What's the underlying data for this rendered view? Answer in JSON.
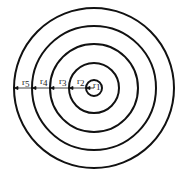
{
  "diagram": {
    "type": "concentric-circles",
    "center": [
      94,
      88
    ],
    "radii": [
      8,
      25,
      44,
      62,
      80
    ],
    "stroke_color": "#111111",
    "labels": [
      {
        "base": "r",
        "sub": "1",
        "x": 89,
        "y": 88
      },
      {
        "base": "r",
        "sub": "2",
        "x": 77,
        "y": 84
      },
      {
        "base": "r",
        "sub": "3",
        "x": 59,
        "y": 84
      },
      {
        "base": "r",
        "sub": "4",
        "x": 40,
        "y": 84
      },
      {
        "base": "r",
        "sub": "5",
        "x": 22,
        "y": 84
      }
    ]
  }
}
